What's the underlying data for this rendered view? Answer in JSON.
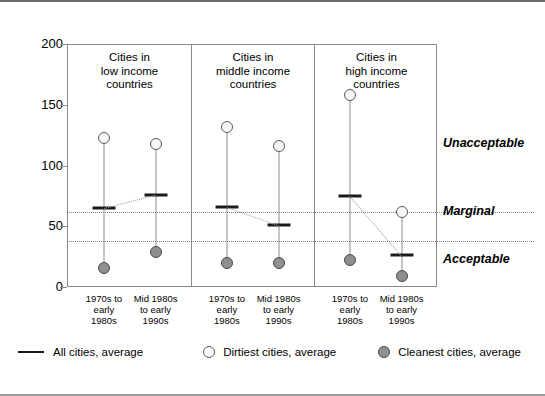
{
  "chart_data": {
    "type": "scatter",
    "title": "",
    "xlabel": "",
    "ylabel": "",
    "ylim": [
      0,
      200
    ],
    "yticks": [
      0,
      50,
      100,
      150,
      200
    ],
    "grid": false,
    "legend_position": "bottom",
    "categories": [
      "1970s to\nearly\n1980s",
      "Mid 1980s\nto early\n1990s"
    ],
    "panels": [
      {
        "title": "Cities in\nlow income\ncountries",
        "points": [
          {
            "period": "1970s to\nearly\n1980s",
            "dirtiest": 123,
            "average": 65,
            "cleanest": 16
          },
          {
            "period": "Mid 1980s\nto early\n1990s",
            "dirtiest": 118,
            "average": 76,
            "cleanest": 29
          }
        ]
      },
      {
        "title": "Cities in\nmiddle income\ncountries",
        "points": [
          {
            "period": "1970s to\nearly\n1980s",
            "dirtiest": 132,
            "average": 66,
            "cleanest": 20
          },
          {
            "period": "Mid 1980s\nto early\n1990s",
            "dirtiest": 116,
            "average": 51,
            "cleanest": 20
          }
        ]
      },
      {
        "title": "Cities in\nhigh income\ncountries",
        "points": [
          {
            "period": "1970s to\nearly\n1980s",
            "dirtiest": 158,
            "average": 75,
            "cleanest": 22
          },
          {
            "period": "Mid 1980s\nto early\n1990s",
            "dirtiest": 62,
            "average": 26,
            "cleanest": 9
          }
        ]
      }
    ],
    "thresholds": [
      {
        "label": "Unacceptable",
        "value": 62,
        "label_y": 118
      },
      {
        "label": "Marginal",
        "value": 38,
        "label_y": 62
      },
      {
        "label": "Acceptable",
        "value": 0,
        "label_y": 22
      }
    ],
    "series": [
      {
        "name": "All cities, average",
        "marker": "line-swatch"
      },
      {
        "name": "Dirtiest cities, average",
        "marker": "open-circle"
      },
      {
        "name": "Cleanest cities, average",
        "marker": "filled-circle"
      }
    ]
  },
  "legend": {
    "all_cities": "All cities, average",
    "dirtiest": "Dirtiest cities, average",
    "cleanest": "Cleanest cities, average"
  },
  "axis": {
    "tick_200": "200",
    "tick_150": "150",
    "tick_100": "100",
    "tick_50": "50",
    "tick_0": "0"
  },
  "bands": {
    "unacceptable": "Unacceptable",
    "marginal": "Marginal",
    "acceptable": "Acceptable"
  },
  "colors": {
    "axis": "#8a8a8a",
    "average_bar": "#1a1a1a",
    "dirtiest_fill": "#f7f7f7",
    "cleanest_fill": "#8f8f8f",
    "threshold_line": "#7d7d7d",
    "stem": "#8d8d8d"
  }
}
